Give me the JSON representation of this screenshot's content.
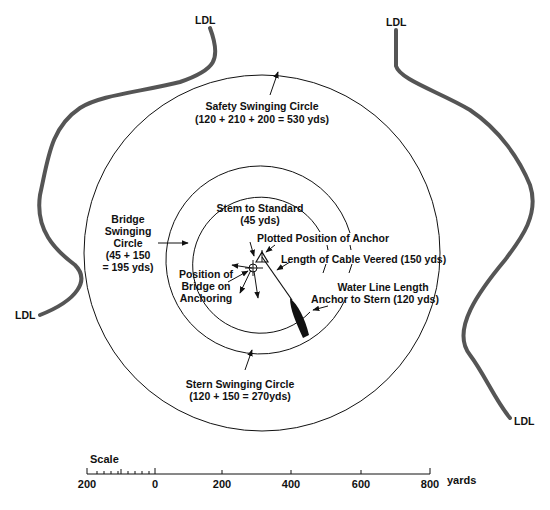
{
  "diagram": {
    "shoreline_label": "LDL",
    "labels": {
      "safety_circle_line1": "Safety Swinging Circle",
      "safety_circle_line2": "(120 + 210 + 200  =  530 yds)",
      "bridge_circle_line1": "Bridge",
      "bridge_circle_line2": "Swinging",
      "bridge_circle_line3": "Circle",
      "bridge_circle_line4": "(45 + 150",
      "bridge_circle_line5": "= 195 yds)",
      "stem_to_standard_line1": "Stem to Standard",
      "stem_to_standard_line2": "(45 yds)",
      "plotted_anchor": "Plotted Position of Anchor",
      "cable_veered": "Length of Cable Veered (150 yds)",
      "bridge_position_line1": "Position of",
      "bridge_position_line2": "Bridge on",
      "bridge_position_line3": "Anchoring",
      "waterline_line1": "Water Line Length",
      "waterline_line2": "Anchor to Stern (120 yds)",
      "stern_circle_line1": "Stern Swinging Circle",
      "stern_circle_line2": "(120 + 150  =  270yds)"
    },
    "circles": [
      {
        "name": "safety",
        "radius_yds": 530
      },
      {
        "name": "stern",
        "radius_yds": 270
      },
      {
        "name": "bridge",
        "radius_yds": 195
      }
    ],
    "colors": {
      "line": "#111111",
      "shoreline": "#555555",
      "background": "#ffffff"
    }
  },
  "scale": {
    "title": "Scale",
    "ticks": [
      "200",
      "0",
      "200",
      "400",
      "600",
      "800"
    ],
    "unit": "yards"
  }
}
